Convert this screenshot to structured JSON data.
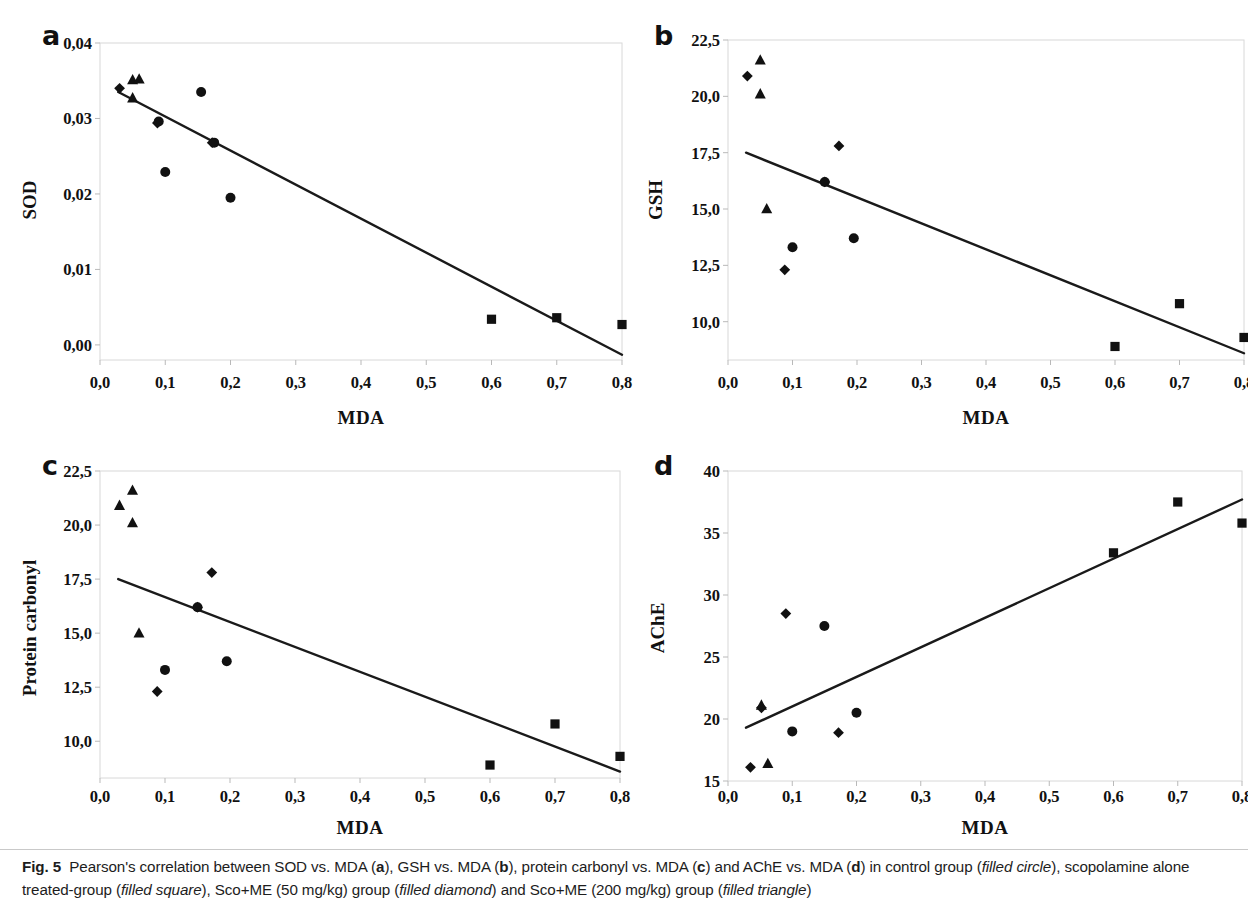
{
  "figure": {
    "label": "Fig. 5",
    "caption_parts": {
      "p1": "Pearson's correlation between SOD vs. MDA (",
      "a": "a",
      "p2": "), GSH vs. MDA (",
      "b": "b",
      "p3": "), protein carbonyl vs. MDA (",
      "c": "c",
      "p4": ") and AChE vs. MDA (",
      "d": "d",
      "p5": ") in control group (",
      "i1": "filled circle",
      "p6": "), scopolamine alone treated-group (",
      "i2": "filled square",
      "p7": "), Sco+ME (50 mg/kg) group (",
      "i3": "filled diamond",
      "p8": ") and Sco+ME (200 mg/kg) group (",
      "i4": "filled triangle",
      "p9": ")"
    }
  },
  "panels": {
    "a": {
      "letter": "a",
      "ylabel": "SOD",
      "xlabel": "MDA"
    },
    "b": {
      "letter": "b",
      "ylabel": "GSH",
      "xlabel": "MDA"
    },
    "c": {
      "letter": "c",
      "ylabel": "Protein carbonyl",
      "xlabel": "MDA"
    },
    "d": {
      "letter": "d",
      "ylabel": "AChE",
      "xlabel": "MDA"
    }
  },
  "chart_data": [
    {
      "id": "a",
      "type": "scatter",
      "title": "SOD vs. MDA",
      "xlabel": "MDA",
      "ylabel": "SOD",
      "xlim": [
        0.0,
        0.8
      ],
      "ylim": [
        -0.002,
        0.04
      ],
      "xticks": [
        0.0,
        0.1,
        0.2,
        0.3,
        0.4,
        0.5,
        0.6,
        0.7,
        0.8
      ],
      "xticklabels": [
        "0,0",
        "0,1",
        "0,2",
        "0,3",
        "0,4",
        "0,5",
        "0,6",
        "0,7",
        "0,8"
      ],
      "yticks": [
        0.0,
        0.01,
        0.02,
        0.03,
        0.04
      ],
      "yticklabels": [
        "0,00",
        "0,01",
        "0,02",
        "0,03",
        "0,04"
      ],
      "grid": false,
      "legend": "none",
      "trendline": {
        "x0": 0.028,
        "y0": 0.0335,
        "x1": 0.8,
        "y1": -0.0013
      },
      "series": [
        {
          "name": "control group",
          "marker": "circle",
          "points": [
            {
              "x": 0.09,
              "y": 0.0296
            },
            {
              "x": 0.1,
              "y": 0.0229
            },
            {
              "x": 0.155,
              "y": 0.0335
            },
            {
              "x": 0.175,
              "y": 0.0268
            },
            {
              "x": 0.2,
              "y": 0.0195
            }
          ]
        },
        {
          "name": "scopolamine alone treated-group",
          "marker": "square",
          "points": [
            {
              "x": 0.6,
              "y": 0.0034
            },
            {
              "x": 0.7,
              "y": 0.0036
            },
            {
              "x": 0.8,
              "y": 0.0027
            }
          ]
        },
        {
          "name": "Sco+ME (50 mg/kg) group",
          "marker": "diamond",
          "points": [
            {
              "x": 0.03,
              "y": 0.034
            },
            {
              "x": 0.088,
              "y": 0.0294
            },
            {
              "x": 0.172,
              "y": 0.0268
            }
          ]
        },
        {
          "name": "Sco+ME (200 mg/kg) group",
          "marker": "triangle",
          "points": [
            {
              "x": 0.05,
              "y": 0.0351
            },
            {
              "x": 0.06,
              "y": 0.0352
            },
            {
              "x": 0.05,
              "y": 0.0327
            }
          ]
        }
      ]
    },
    {
      "id": "b",
      "type": "scatter",
      "title": "GSH vs. MDA",
      "xlabel": "MDA",
      "ylabel": "GSH",
      "xlim": [
        0.0,
        0.8
      ],
      "ylim": [
        8.3,
        22.5
      ],
      "xticks": [
        0.0,
        0.1,
        0.2,
        0.3,
        0.4,
        0.5,
        0.6,
        0.7,
        0.8
      ],
      "xticklabels": [
        "0,0",
        "0,1",
        "0,2",
        "0,3",
        "0,4",
        "0,5",
        "0,6",
        "0,7",
        "0,8"
      ],
      "yticks": [
        10.0,
        12.5,
        15.0,
        17.5,
        20.0,
        22.5
      ],
      "yticklabels": [
        "10,0",
        "12,5",
        "15,0",
        "17,5",
        "20,0",
        "22,5"
      ],
      "grid": false,
      "legend": "none",
      "trendline": {
        "x0": 0.028,
        "y0": 17.5,
        "x1": 0.8,
        "y1": 8.6
      },
      "series": [
        {
          "name": "control group",
          "marker": "circle",
          "points": [
            {
              "x": 0.1,
              "y": 13.3
            },
            {
              "x": 0.15,
              "y": 16.2
            },
            {
              "x": 0.195,
              "y": 13.7
            }
          ]
        },
        {
          "name": "scopolamine alone treated-group",
          "marker": "square",
          "points": [
            {
              "x": 0.6,
              "y": 8.9
            },
            {
              "x": 0.7,
              "y": 10.8
            },
            {
              "x": 0.8,
              "y": 9.3
            }
          ]
        },
        {
          "name": "Sco+ME (50 mg/kg) group",
          "marker": "diamond",
          "points": [
            {
              "x": 0.03,
              "y": 20.9
            },
            {
              "x": 0.088,
              "y": 12.3
            },
            {
              "x": 0.172,
              "y": 17.8
            },
            {
              "x": 0.15,
              "y": 16.2
            }
          ]
        },
        {
          "name": "Sco+ME (200 mg/kg) group",
          "marker": "triangle",
          "points": [
            {
              "x": 0.05,
              "y": 21.6
            },
            {
              "x": 0.05,
              "y": 20.1
            },
            {
              "x": 0.06,
              "y": 15.0
            }
          ]
        }
      ]
    },
    {
      "id": "c",
      "type": "scatter",
      "title": "Protein carbonyl vs. MDA",
      "xlabel": "MDA",
      "ylabel": "Protein carbonyl",
      "xlim": [
        0.0,
        0.8
      ],
      "ylim": [
        8.3,
        22.5
      ],
      "xticks": [
        0.0,
        0.1,
        0.2,
        0.3,
        0.4,
        0.5,
        0.6,
        0.7,
        0.8
      ],
      "xticklabels": [
        "0,0",
        "0,1",
        "0,2",
        "0,3",
        "0,4",
        "0,5",
        "0,6",
        "0,7",
        "0,8"
      ],
      "yticks": [
        10.0,
        12.5,
        15.0,
        17.5,
        20.0,
        22.5
      ],
      "yticklabels": [
        "10,0",
        "12,5",
        "15,0",
        "17,5",
        "20,0",
        "22,5"
      ],
      "grid": false,
      "legend": "none",
      "trendline": {
        "x0": 0.028,
        "y0": 17.5,
        "x1": 0.8,
        "y1": 8.6
      },
      "series": [
        {
          "name": "control group",
          "marker": "circle",
          "points": [
            {
              "x": 0.1,
              "y": 13.3
            },
            {
              "x": 0.15,
              "y": 16.2
            },
            {
              "x": 0.195,
              "y": 13.7
            }
          ]
        },
        {
          "name": "scopolamine alone treated-group",
          "marker": "square",
          "points": [
            {
              "x": 0.6,
              "y": 8.9
            },
            {
              "x": 0.7,
              "y": 10.8
            },
            {
              "x": 0.8,
              "y": 9.3
            }
          ]
        },
        {
          "name": "Sco+ME (50 mg/kg) group",
          "marker": "diamond",
          "points": [
            {
              "x": 0.088,
              "y": 12.3
            },
            {
              "x": 0.15,
              "y": 16.2
            },
            {
              "x": 0.172,
              "y": 17.8
            }
          ]
        },
        {
          "name": "Sco+ME (200 mg/kg) group",
          "marker": "triangle",
          "points": [
            {
              "x": 0.03,
              "y": 20.9
            },
            {
              "x": 0.05,
              "y": 21.6
            },
            {
              "x": 0.05,
              "y": 20.1
            },
            {
              "x": 0.06,
              "y": 15.0
            }
          ]
        }
      ]
    },
    {
      "id": "d",
      "type": "scatter",
      "title": "AChE vs. MDA",
      "xlabel": "MDA",
      "ylabel": "AChE",
      "xlim": [
        0.0,
        0.8
      ],
      "ylim": [
        15.0,
        40.0
      ],
      "xticks": [
        0.0,
        0.1,
        0.2,
        0.3,
        0.4,
        0.5,
        0.6,
        0.7,
        0.8
      ],
      "xticklabels": [
        "0,0",
        "0,1",
        "0,2",
        "0,3",
        "0,4",
        "0,5",
        "0,6",
        "0,7",
        "0,8"
      ],
      "yticks": [
        15,
        20,
        25,
        30,
        35,
        40
      ],
      "yticklabels": [
        "15",
        "20",
        "25",
        "30",
        "35",
        "40"
      ],
      "grid": false,
      "legend": "none",
      "trendline": {
        "x0": 0.028,
        "y0": 19.3,
        "x1": 0.8,
        "y1": 37.7
      },
      "series": [
        {
          "name": "control group",
          "marker": "circle",
          "points": [
            {
              "x": 0.1,
              "y": 19.0
            },
            {
              "x": 0.15,
              "y": 27.5
            },
            {
              "x": 0.2,
              "y": 20.5
            }
          ]
        },
        {
          "name": "scopolamine alone treated-group",
          "marker": "square",
          "points": [
            {
              "x": 0.6,
              "y": 33.4
            },
            {
              "x": 0.7,
              "y": 37.5
            },
            {
              "x": 0.8,
              "y": 35.8
            }
          ]
        },
        {
          "name": "Sco+ME (50 mg/kg) group",
          "marker": "diamond",
          "points": [
            {
              "x": 0.035,
              "y": 16.1
            },
            {
              "x": 0.052,
              "y": 20.9
            },
            {
              "x": 0.09,
              "y": 28.5
            },
            {
              "x": 0.172,
              "y": 18.9
            }
          ]
        },
        {
          "name": "Sco+ME (200 mg/kg) group",
          "marker": "triangle",
          "points": [
            {
              "x": 0.052,
              "y": 21.1
            },
            {
              "x": 0.062,
              "y": 16.4
            }
          ]
        }
      ]
    }
  ]
}
